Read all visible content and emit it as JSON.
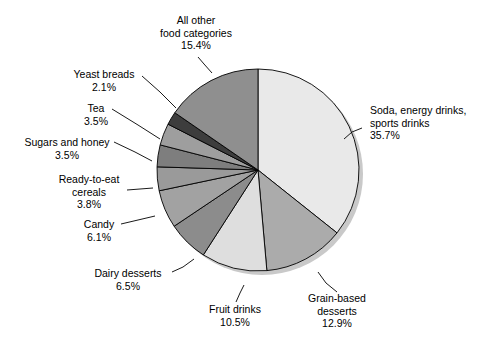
{
  "chart_data": {
    "type": "pie",
    "title": "",
    "subtitle": "",
    "xlabel": "",
    "ylabel": "",
    "legend_position": "none",
    "grid": false,
    "units": "percent",
    "start_angle_deg": 0,
    "direction": "clockwise",
    "categories": [
      "Soda, energy drinks, sports drinks",
      "Grain-based desserts",
      "Fruit drinks",
      "Dairy desserts",
      "Candy",
      "Ready-to-eat cereals",
      "Sugars and honey",
      "Tea",
      "Yeast breads",
      "All other food categories"
    ],
    "values": [
      35.7,
      12.9,
      10.5,
      6.5,
      6.1,
      3.8,
      3.5,
      3.5,
      2.1,
      15.4
    ],
    "slices": [
      {
        "name": "Soda, energy drinks, sports drinks",
        "value": 35.7,
        "value_label": "35.7%",
        "color": "#e9e9e9",
        "label_lines": [
          "Soda, energy drinks,",
          "sports drinks",
          "35.7%"
        ],
        "label_x": 370,
        "label_y": 114,
        "label_anchor": "start",
        "leader": "M 362 128 L 352 132 L 344 139"
      },
      {
        "name": "Grain-based desserts",
        "value": 12.9,
        "value_label": "12.9%",
        "color": "#ababab",
        "label_lines": [
          "Grain-based",
          "desserts",
          "12.9%"
        ],
        "label_x": 337,
        "label_y": 302,
        "label_anchor": "middle",
        "leader": "M 337 292 L 326 283 L 318 272"
      },
      {
        "name": "Fruit drinks",
        "value": 10.5,
        "value_label": "10.5%",
        "color": "#dedede",
        "label_lines": [
          "Fruit drinks",
          "10.5%"
        ],
        "label_x": 235,
        "label_y": 313,
        "label_anchor": "middle",
        "leader": "M 236 302 L 240 293 L 244 285"
      },
      {
        "name": "Dairy desserts",
        "value": 6.5,
        "value_label": "6.5%",
        "color": "#8c8c8c",
        "label_lines": [
          "Dairy desserts",
          "6.5%"
        ],
        "label_x": 128,
        "label_y": 277,
        "label_anchor": "middle",
        "leader": "M 172 272 L 183 267 L 194 259"
      },
      {
        "name": "Candy",
        "value": 6.1,
        "value_label": "6.1%",
        "color": "#a2a2a2",
        "label_lines": [
          "Candy",
          "6.1%"
        ],
        "label_x": 99,
        "label_y": 228,
        "label_anchor": "middle",
        "leader": "M 121 224 L 138 220 L 155 216"
      },
      {
        "name": "Ready-to-eat cereals",
        "value": 3.8,
        "value_label": "3.8%",
        "color": "#9a9a9a",
        "label_lines": [
          "Ready-to-eat",
          "cereals",
          "3.8%"
        ],
        "label_x": 89,
        "label_y": 183,
        "label_anchor": "middle",
        "leader": "M 127 190 L 140 189 L 153 188"
      },
      {
        "name": "Sugars and honey",
        "value": 3.5,
        "value_label": "3.5%",
        "color": "#7e7e7e",
        "label_lines": [
          "Sugars and honey",
          "3.5%"
        ],
        "label_x": 67,
        "label_y": 146,
        "label_anchor": "middle",
        "leader": "M 114 142 L 135 152 L 152 161"
      },
      {
        "name": "Tea",
        "value": 3.5,
        "value_label": "3.5%",
        "color": "#9e9e9e",
        "label_lines": [
          "Tea",
          "3.5%"
        ],
        "label_x": 96,
        "label_y": 112,
        "label_anchor": "middle",
        "leader": "M 112 109 L 138 125 L 160 139"
      },
      {
        "name": "Yeast breads",
        "value": 2.1,
        "value_label": "2.1%",
        "color": "#3d3d3d",
        "label_lines": [
          "Yeast breads",
          "2.1%"
        ],
        "label_x": 104,
        "label_y": 78,
        "label_anchor": "middle",
        "leader": "M 142 76 L 160 92 L 176 108"
      },
      {
        "name": "All other food categories",
        "value": 15.4,
        "value_label": "15.4%",
        "color": "#8f8f8f",
        "label_lines": [
          "All other",
          "food categories",
          "15.4%"
        ],
        "label_x": 196,
        "label_y": 24,
        "label_anchor": "middle",
        "leader": "M 198 57 L 204 64 L 212 73"
      }
    ],
    "geometry": {
      "cx": 258,
      "cy": 170,
      "r": 101
    },
    "colors": {
      "outline": "#000000",
      "background": "#ffffff",
      "shadow": "#c9c9c9"
    }
  }
}
